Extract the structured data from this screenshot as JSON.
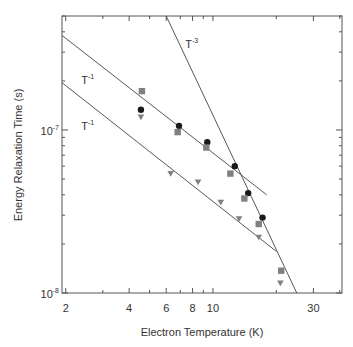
{
  "chart_data": {
    "type": "scatter",
    "title": "",
    "xlabel": "Electron Temperature (K)",
    "ylabel": "Energy Relaxation Time (s)",
    "xscale": "log",
    "yscale": "log",
    "xlim": [
      1.92,
      41
    ],
    "ylim": [
      1e-08,
      5e-07
    ],
    "grid": false,
    "legend": null,
    "x_ticks": [
      {
        "value": 2,
        "label": "2"
      },
      {
        "value": 4,
        "label": "4"
      },
      {
        "value": 6,
        "label": "6"
      },
      {
        "value": 8,
        "label": "8"
      },
      {
        "value": 10,
        "label": "10"
      },
      {
        "value": 30,
        "label": "30"
      }
    ],
    "y_ticks": [
      {
        "value": 1e-07,
        "base": "10",
        "exp": "-7"
      },
      {
        "value": 1e-08,
        "base": "10",
        "exp": "-8"
      }
    ],
    "series": [
      {
        "name": "circles",
        "marker": "circle",
        "color": "#1a1a1a",
        "x": [
          4.55,
          6.9,
          9.4,
          12.7,
          14.7,
          17.2
        ],
        "y": [
          1.33e-07,
          1.06e-07,
          8.4e-08,
          6e-08,
          4.1e-08,
          2.9e-08
        ]
      },
      {
        "name": "squares",
        "marker": "square",
        "color": "#808080",
        "x": [
          4.6,
          6.8,
          9.3,
          12.1,
          14.1,
          16.5,
          21.1
        ],
        "y": [
          1.73e-07,
          9.7e-08,
          7.8e-08,
          5.4e-08,
          3.8e-08,
          2.65e-08,
          1.37e-08
        ]
      },
      {
        "name": "triangles",
        "marker": "triangle-down",
        "color": "#808080",
        "x": [
          4.55,
          6.3,
          8.5,
          10.9,
          13.3,
          16.5,
          20.9
        ],
        "y": [
          1.2e-07,
          5.4e-08,
          4.8e-08,
          3.6e-08,
          2.85e-08,
          2.2e-08,
          1.15e-08
        ]
      }
    ],
    "fit_lines": [
      {
        "name": "upper T^-1",
        "label_base": "T",
        "label_exp": "-1",
        "x": [
          1.92,
          18.0
        ],
        "y": [
          3.8e-07,
          4e-08
        ]
      },
      {
        "name": "lower T^-1",
        "label_base": "T",
        "label_exp": "-1",
        "x": [
          1.92,
          20.0
        ],
        "y": [
          1.95e-07,
          1.8e-08
        ]
      },
      {
        "name": "T^-3",
        "label_base": "T",
        "label_exp": "-3",
        "x": [
          6.0,
          25.0
        ],
        "y": [
          5e-07,
          1e-08
        ]
      }
    ],
    "annotations": [
      {
        "text_base": "T",
        "text_exp": "-1",
        "near": "upper T^-1 line",
        "x": 2.5,
        "y": 2e-07
      },
      {
        "text_base": "T",
        "text_exp": "-1",
        "near": "lower T^-1 line",
        "x": 2.5,
        "y": 1.05e-07
      },
      {
        "text_base": "T",
        "text_exp": "-3",
        "near": "T^-3 line",
        "x": 7.8,
        "y": 3.3e-07
      }
    ]
  },
  "axes": {
    "xlabel": "Electron Temperature (K)",
    "ylabel": "Energy Relaxation Time (s)"
  }
}
